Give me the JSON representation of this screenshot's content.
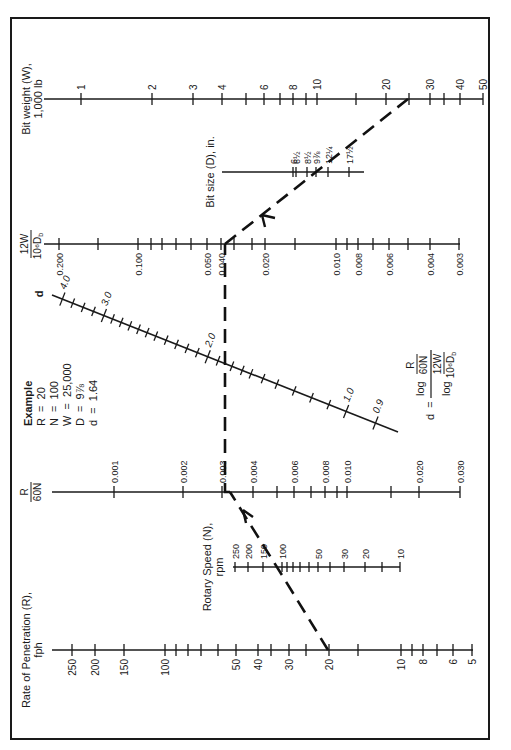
{
  "figure": {
    "orientation": "rotated-90-ccw",
    "example": {
      "title": "Example",
      "lines": [
        "R  =  20",
        "N  =  100",
        "W  =  25,000",
        "D  =  9⅞",
        "d  =  1.64"
      ]
    },
    "formula": {
      "lhs": "d  =",
      "num_log": "log",
      "num_top": "R",
      "num_bot": "60N",
      "den_log": "log",
      "den_top": "12W",
      "den_bot": "10⁶D",
      "den_sub": "b"
    }
  },
  "chart_data": {
    "type": "nomogram",
    "axes": [
      {
        "id": "rop",
        "label_line1": "Rate of Penetration (R),",
        "label_line2": "fph",
        "scale": "log",
        "ticks": [
          {
            "v": "250",
            "x": 72
          },
          {
            "v": "200",
            "x": 95
          },
          {
            "v": "150",
            "x": 124
          },
          {
            "v": "100",
            "x": 165
          },
          {
            "v": "",
            "x": 176
          },
          {
            "v": "",
            "x": 188
          },
          {
            "v": "",
            "x": 201
          },
          {
            "v": "",
            "x": 218
          },
          {
            "v": "50",
            "x": 236
          },
          {
            "v": "40",
            "x": 258
          },
          {
            "v": "",
            "x": 271
          },
          {
            "v": "30",
            "x": 289
          },
          {
            "v": "",
            "x": 306
          },
          {
            "v": "20",
            "x": 329
          },
          {
            "v": "",
            "x": 358
          },
          {
            "v": "10",
            "x": 401
          },
          {
            "v": "",
            "x": 412
          },
          {
            "v": "8",
            "x": 423
          },
          {
            "v": "",
            "x": 437
          },
          {
            "v": "6",
            "x": 453
          },
          {
            "v": "5",
            "x": 472
          }
        ]
      },
      {
        "id": "rotary-speed",
        "label_line1": "Rotary Speed (N),",
        "label_line2": "rpm",
        "scale": "log",
        "ticks": [
          {
            "v": "250",
            "x": 235
          },
          {
            "v": "200",
            "x": 248
          },
          {
            "v": "150",
            "x": 263
          },
          {
            "v": "100",
            "x": 282
          },
          {
            "v": "",
            "x": 287
          },
          {
            "v": "",
            "x": 293
          },
          {
            "v": "",
            "x": 300
          },
          {
            "v": "",
            "x": 309
          },
          {
            "v": "50",
            "x": 318
          },
          {
            "v": "",
            "x": 330
          },
          {
            "v": "30",
            "x": 344
          },
          {
            "v": "20",
            "x": 365
          },
          {
            "v": "",
            "x": 382
          },
          {
            "v": "10",
            "x": 400
          }
        ]
      },
      {
        "id": "r-over-60n",
        "label_top": "R",
        "label_bot": "60N",
        "scale": "log",
        "ticks": [
          {
            "v": "0.001",
            "x": 114
          },
          {
            "v": "0.002",
            "x": 183
          },
          {
            "v": "0.003",
            "x": 222
          },
          {
            "v": "0.004",
            "x": 253
          },
          {
            "v": "",
            "x": 277
          },
          {
            "v": "0.006",
            "x": 294
          },
          {
            "v": "",
            "x": 311
          },
          {
            "v": "0.008",
            "x": 325
          },
          {
            "v": "",
            "x": 337
          },
          {
            "v": "0.010",
            "x": 347
          },
          {
            "v": "",
            "x": 391
          },
          {
            "v": "0.020",
            "x": 419
          },
          {
            "v": "0.030",
            "x": 460
          }
        ]
      },
      {
        "id": "d-exponent",
        "label": "d",
        "scale": "log",
        "major": [
          {
            "v": "4.0",
            "t": 0.03
          },
          {
            "v": "3.0",
            "t": 0.15
          },
          {
            "v": "2.0",
            "t": 0.45
          },
          {
            "v": "1.0",
            "t": 0.85
          },
          {
            "v": "0.9",
            "t": 0.935
          }
        ],
        "minor_t": [
          0.06,
          0.09,
          0.12,
          0.175,
          0.2,
          0.225,
          0.25,
          0.275,
          0.3,
          0.33,
          0.36,
          0.39,
          0.42,
          0.48,
          0.52,
          0.55,
          0.575,
          0.61,
          0.65,
          0.7,
          0.75,
          0.8
        ]
      },
      {
        "id": "twelve-w-over-d",
        "label_top": "12W",
        "label_bot": "10⁶D",
        "label_sub": "b",
        "scale": "log",
        "ticks": [
          {
            "v": "0.200",
            "x": 59
          },
          {
            "v": "",
            "x": 98
          },
          {
            "v": "0.100",
            "x": 138
          },
          {
            "v": "",
            "x": 151
          },
          {
            "v": "",
            "x": 162
          },
          {
            "v": "",
            "x": 176
          },
          {
            "v": "",
            "x": 191
          },
          {
            "v": "0.050",
            "x": 207
          },
          {
            "v": "0.040",
            "x": 221
          },
          {
            "v": "",
            "x": 234
          },
          {
            "v": "",
            "x": 252
          },
          {
            "v": "0.020",
            "x": 265
          },
          {
            "v": "",
            "x": 295
          },
          {
            "v": "0.010",
            "x": 336
          },
          {
            "v": "",
            "x": 347
          },
          {
            "v": "0.008",
            "x": 358
          },
          {
            "v": "",
            "x": 373
          },
          {
            "v": "0.006",
            "x": 389
          },
          {
            "v": "",
            "x": 408
          },
          {
            "v": "0.004",
            "x": 430
          },
          {
            "v": "0.003",
            "x": 459
          }
        ]
      },
      {
        "id": "bit-size",
        "label": "Bit size (D), in.",
        "scale": "log",
        "ticks": [
          {
            "v": "6",
            "x": 293
          },
          {
            "v": "6½",
            "x": 296
          },
          {
            "v": "8½",
            "x": 307
          },
          {
            "v": "9⅞",
            "x": 316
          },
          {
            "v": "12¼",
            "x": 328
          },
          {
            "v": "17½",
            "x": 349
          }
        ]
      },
      {
        "id": "bit-weight",
        "label_line1": "Bit weight (W),",
        "label_line2": "1,000 lb",
        "scale": "log",
        "ticks": [
          {
            "v": "1",
            "x": 81
          },
          {
            "v": "2",
            "x": 152
          },
          {
            "v": "3",
            "x": 193
          },
          {
            "v": "4",
            "x": 222
          },
          {
            "v": "",
            "x": 246
          },
          {
            "v": "6",
            "x": 264
          },
          {
            "v": "",
            "x": 280
          },
          {
            "v": "8",
            "x": 293
          },
          {
            "v": "",
            "x": 306
          },
          {
            "v": "10",
            "x": 317
          },
          {
            "v": "",
            "x": 356
          },
          {
            "v": "20",
            "x": 386
          },
          {
            "v": "",
            "x": 409
          },
          {
            "v": "30",
            "x": 430
          },
          {
            "v": "",
            "x": 444
          },
          {
            "v": "40",
            "x": 460
          },
          {
            "v": "50",
            "x": 483
          }
        ]
      }
    ],
    "example_solution": {
      "R": 20,
      "N": 100,
      "W": 25000,
      "D": "9 7/8",
      "d": 1.64
    }
  }
}
